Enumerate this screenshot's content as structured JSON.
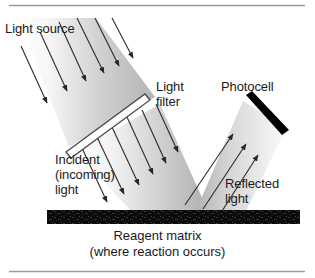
{
  "figure": {
    "labels": {
      "light_source": "Light source",
      "light_filter": "Light\nfilter",
      "photocell": "Photocell",
      "incident_light": "Incident\n(incoming)\nlight",
      "reflected_light": "Reflected\nlight"
    },
    "caption": "Reagent matrix\n(where reaction occurs)",
    "colors": {
      "text": "#1a1a1a",
      "rule": "#9a9a9a",
      "beam_light": "#fdfdfd",
      "beam_mid": "#c8c8c8",
      "beam_dark": "#a9a9a9",
      "matrix": "#0d0d0d",
      "photocell": "#000000",
      "filter_outline": "#4a4a4a",
      "filter_fill": "#ffffff",
      "arrow": "#2b2b2b"
    },
    "counts": {
      "incident_upper_arrows": 6,
      "incident_lower_arrows": 6,
      "reflected_arrows": 3
    }
  }
}
